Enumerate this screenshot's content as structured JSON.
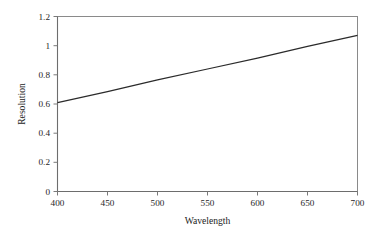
{
  "chart_data": {
    "type": "line",
    "title": "",
    "xlabel": "Wavelength",
    "ylabel": "Resolution",
    "xlim": [
      400,
      700
    ],
    "ylim": [
      0,
      1.2
    ],
    "grid": false,
    "legend": "none",
    "x_ticks": [
      400,
      450,
      500,
      550,
      600,
      650,
      700
    ],
    "x_tick_labels": [
      "400",
      "450",
      "500",
      "550",
      "600",
      "650",
      "700"
    ],
    "y_ticks": [
      0,
      0.2,
      0.4,
      0.6,
      0.8,
      1,
      1.2
    ],
    "y_tick_labels": [
      "0",
      "0.2",
      "0.4",
      "0.6",
      "0.8",
      "1",
      "1.2"
    ],
    "series": [
      {
        "name": "Resolution vs Wavelength",
        "color": "#2b2b2b",
        "x": [
          400,
          450,
          500,
          550,
          600,
          650,
          700
        ],
        "values": [
          0.61,
          0.685,
          0.765,
          0.84,
          0.915,
          0.995,
          1.07
        ]
      }
    ]
  },
  "style": {
    "frame_color": "#8a8a8a",
    "tick_color": "#7a7a7a",
    "text_color": "#262626",
    "background": "#ffffff"
  }
}
